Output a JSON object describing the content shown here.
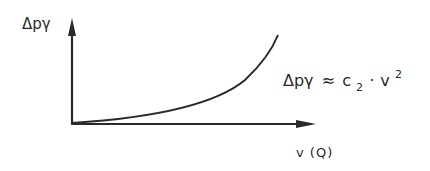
{
  "diagram": {
    "type": "qualitative-curve",
    "y_axis": {
      "label": "Δpγ"
    },
    "x_axis": {
      "label": "v (Q)"
    },
    "curve": {
      "shape": "quadratic, rising",
      "formula": {
        "lhs": "Δpγ",
        "relation": "≈",
        "coeff": "c",
        "coeff_sub": "2",
        "dot": "·",
        "var": "v",
        "exp": "2"
      }
    },
    "colors": {
      "line": "#2a2a2a",
      "background": "#ffffff"
    }
  }
}
